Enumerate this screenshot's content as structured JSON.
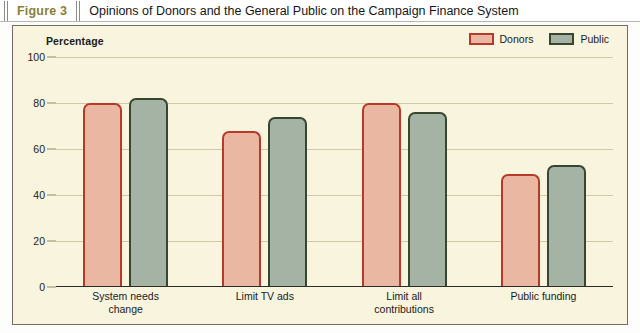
{
  "header": {
    "figure_label": "Figure 3",
    "title": "Opinions of Donors and the General Public on the Campaign Finance System"
  },
  "chart_data": {
    "type": "bar",
    "title": "Opinions of Donors and the General Public on the Campaign Finance System",
    "ylabel": "Percentage",
    "xlabel": "",
    "ylim": [
      0,
      100
    ],
    "yticks": [
      0,
      20,
      40,
      60,
      80,
      100
    ],
    "grid": true,
    "legend_position": "top-right",
    "categories": [
      "System needs change",
      "Limit TV ads",
      "Limit all contributions",
      "Public funding"
    ],
    "category_lines": [
      [
        "System needs",
        "change"
      ],
      [
        "Limit TV ads",
        ""
      ],
      [
        "Limit all",
        "contributions"
      ],
      [
        "Public funding",
        ""
      ]
    ],
    "series": [
      {
        "name": "Donors",
        "color": "#eab8a2",
        "border": "#b8392a",
        "values": [
          80,
          68,
          80,
          49
        ]
      },
      {
        "name": "Public",
        "color": "#a4b3a3",
        "border": "#37462f",
        "values": [
          82,
          74,
          76,
          53
        ]
      }
    ]
  },
  "colors": {
    "panel_background": "#f8f4de",
    "figure_label": "#8a7f36",
    "gridline": "#cfc9a8",
    "axis": "#2b2b28"
  }
}
